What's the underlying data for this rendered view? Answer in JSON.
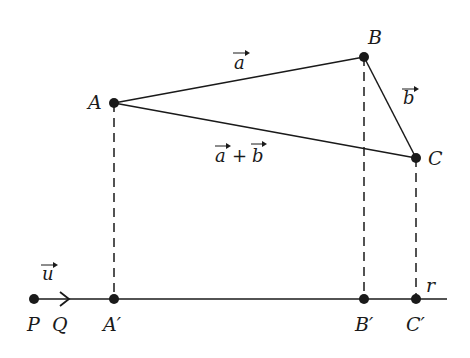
{
  "diagram": {
    "colors": {
      "stroke": "#1a1a1a",
      "background": "#ffffff"
    },
    "points": [
      {
        "id": "A",
        "label": "A",
        "x": 114,
        "y": 103
      },
      {
        "id": "B",
        "label": "B",
        "x": 364,
        "y": 57
      },
      {
        "id": "C",
        "label": "C",
        "x": 416,
        "y": 158
      },
      {
        "id": "P",
        "label": "P",
        "x": 34,
        "y": 299
      },
      {
        "id": "A1",
        "label": "A′",
        "x": 114,
        "y": 299
      },
      {
        "id": "B1",
        "label": "B′",
        "x": 364,
        "y": 299
      },
      {
        "id": "C1",
        "label": "C′",
        "x": 416,
        "y": 299
      }
    ],
    "labels": {
      "A": "A",
      "B": "B",
      "C": "C",
      "P": "P",
      "Q": "Q",
      "A_prime": "A′",
      "B_prime": "B′",
      "C_prime": "C′",
      "line": "r"
    },
    "vectors": {
      "a": "a",
      "b": "b",
      "sum_a": "a",
      "sum_plus": "+",
      "sum_b": "b",
      "u": "u"
    },
    "edges": [
      {
        "from": "A",
        "to": "B",
        "label": "a",
        "style": "solid"
      },
      {
        "from": "B",
        "to": "C",
        "label": "b",
        "style": "solid"
      },
      {
        "from": "A",
        "to": "C",
        "label": "a + b",
        "style": "solid"
      },
      {
        "from": "A",
        "to": "A1",
        "style": "dashed"
      },
      {
        "from": "B",
        "to": "B1",
        "style": "dashed"
      },
      {
        "from": "C",
        "to": "C1",
        "style": "dashed"
      },
      {
        "from": "P",
        "to": "Q",
        "label": "u",
        "style": "arrow"
      }
    ]
  }
}
